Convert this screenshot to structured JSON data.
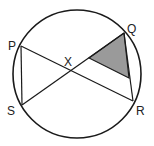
{
  "diagram": {
    "colors": {
      "stroke": "#1a1a1a",
      "shade": "#9a9a9a",
      "background": "#ffffff"
    },
    "circle": {
      "cx": 77,
      "cy": 74,
      "r": 64
    },
    "points": {
      "P": {
        "label": "P",
        "x": 21,
        "y": 46
      },
      "Q": {
        "label": "Q",
        "x": 124,
        "y": 33
      },
      "R": {
        "label": "R",
        "x": 133,
        "y": 101
      },
      "S": {
        "label": "S",
        "x": 22,
        "y": 105
      },
      "X": {
        "label": "X",
        "x": 70,
        "y": 70
      }
    },
    "segments": [
      {
        "from": "P",
        "to": "R"
      },
      {
        "from": "S",
        "to": "Q"
      },
      {
        "from": "P",
        "to": "S"
      },
      {
        "from": "Q",
        "to": "R"
      }
    ],
    "shaded_triangle": {
      "vertices": [
        [
          89,
          58
        ],
        [
          124,
          33
        ],
        [
          129,
          78
        ]
      ]
    }
  }
}
